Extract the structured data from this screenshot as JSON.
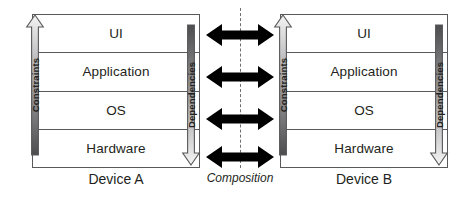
{
  "diagram": {
    "center": {
      "label": "Composition",
      "axis_style": "dash-dot",
      "arrow_count": 4,
      "arrow_kind": "double-headed",
      "arrow_color": "#000000"
    },
    "devices": [
      {
        "id": "device-a",
        "caption": "Device A",
        "layers": [
          {
            "name": "UI"
          },
          {
            "name": "Application"
          },
          {
            "name": "OS"
          },
          {
            "name": "Hardware"
          }
        ],
        "left_arrow": {
          "label": "Constraints",
          "direction": "up",
          "gradient_from": "#4d4d4f",
          "gradient_to": "#f2f2f2"
        },
        "right_arrow": {
          "label": "Dependencies",
          "direction": "down",
          "gradient_from": "#4d4d4f",
          "gradient_to": "#f2f2f2"
        }
      },
      {
        "id": "device-b",
        "caption": "Device B",
        "layers": [
          {
            "name": "UI"
          },
          {
            "name": "Application"
          },
          {
            "name": "OS"
          },
          {
            "name": "Hardware"
          }
        ],
        "left_arrow": {
          "label": "Constraints",
          "direction": "up",
          "gradient_from": "#4d4d4f",
          "gradient_to": "#f2f2f2"
        },
        "right_arrow": {
          "label": "Dependencies",
          "direction": "down",
          "gradient_from": "#4d4d4f",
          "gradient_to": "#f2f2f2"
        }
      }
    ],
    "colors": {
      "stroke": "#59595b",
      "text": "#231f20",
      "background": "#ffffff",
      "arrow_fill": "#000000",
      "axis": "#6f6f72"
    }
  }
}
